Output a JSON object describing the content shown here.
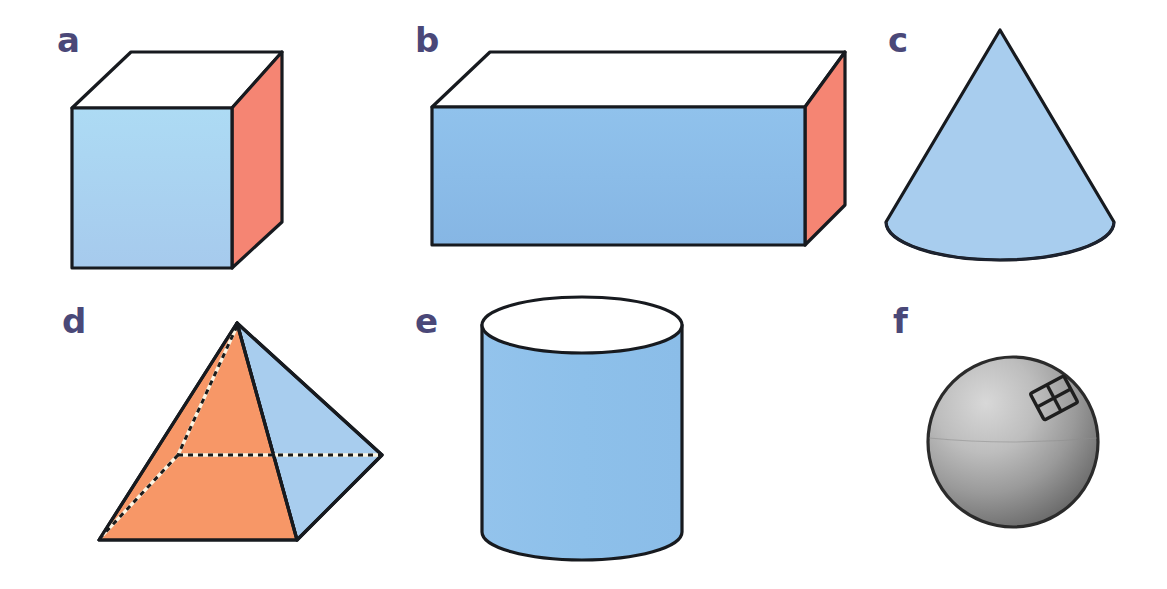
{
  "figure": {
    "background_color": "#ffffff",
    "label_color": "#4a4878",
    "panels": [
      {
        "key": "a",
        "label": "a",
        "shape_name": "cube",
        "label_x": 57,
        "label_y": 52,
        "faces": {
          "front": "#a8cdee",
          "right": "#f58573",
          "top": "#ffffff"
        },
        "outline_color": "#171a1f"
      },
      {
        "key": "b",
        "label": "b",
        "shape_name": "rectangular-prism",
        "label_x": 415,
        "label_y": 52,
        "faces": {
          "front": "#8bbce8",
          "right": "#f58573",
          "top": "#ffffff"
        },
        "outline_color": "#171a1f"
      },
      {
        "key": "c",
        "label": "c",
        "shape_name": "cone",
        "label_x": 888,
        "label_y": 52,
        "faces": {
          "body": "#a8cdee",
          "base": "#a8cdee"
        },
        "outline_color": "#1d2330"
      },
      {
        "key": "d",
        "label": "d",
        "shape_name": "square-pyramid",
        "label_x": 62,
        "label_y": 333,
        "faces": {
          "front_left": "#f79767",
          "right": "#a8cdee"
        },
        "hidden_edge_style": "dashed",
        "outline_color": "#2b2b2b"
      },
      {
        "key": "e",
        "label": "e",
        "shape_name": "cylinder",
        "label_x": 415,
        "label_y": 333,
        "faces": {
          "body": "#8fc1ea",
          "top": "#ffffff"
        },
        "outline_color": "#171a1f"
      },
      {
        "key": "f",
        "label": "f",
        "shape_name": "sphere",
        "label_x": 893,
        "label_y": 333,
        "faces": {
          "body_light": "#c9c9c9",
          "body_dark": "#6e6e6e"
        },
        "highlight": "window-reflection",
        "outline_color": "#2b2b2b"
      }
    ]
  }
}
